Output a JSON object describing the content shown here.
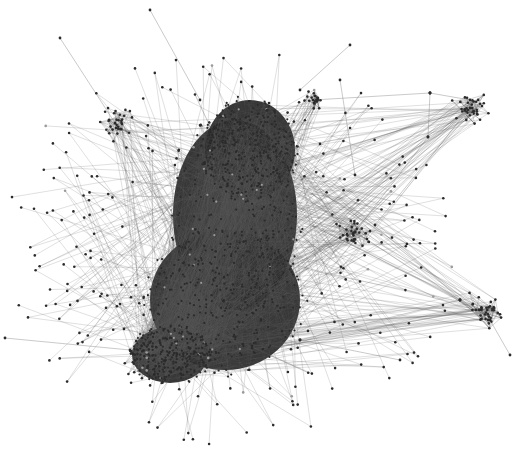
{
  "diagram": {
    "type": "network-graph",
    "width": 520,
    "height": 463,
    "colors": {
      "background": "#ffffff",
      "node": "#2b2b2b",
      "node_light": "#9a9a9a",
      "edge": "#5a5a5a",
      "core_fill": "#262626"
    },
    "core": {
      "description": "dense central cluster",
      "blobs": [
        {
          "cx": 235,
          "cy": 215,
          "rx": 62,
          "ry": 95
        },
        {
          "cx": 225,
          "cy": 300,
          "rx": 75,
          "ry": 70
        },
        {
          "cx": 170,
          "cy": 355,
          "rx": 38,
          "ry": 28
        },
        {
          "cx": 250,
          "cy": 150,
          "rx": 45,
          "ry": 50
        }
      ],
      "node_count": 900,
      "edge_count": 1400
    },
    "clusters": [
      {
        "name": "top-left",
        "cx": 115,
        "cy": 123,
        "r": 12,
        "nodes": 30
      },
      {
        "name": "top-center-spike",
        "cx": 313,
        "cy": 100,
        "r": 8,
        "nodes": 18
      },
      {
        "name": "top-right",
        "cx": 470,
        "cy": 108,
        "r": 14,
        "nodes": 40
      },
      {
        "name": "mid-right",
        "cx": 355,
        "cy": 232,
        "r": 12,
        "nodes": 30
      },
      {
        "name": "right-lower",
        "cx": 485,
        "cy": 310,
        "r": 14,
        "nodes": 40
      },
      {
        "name": "bottom-left",
        "cx": 140,
        "cy": 360,
        "r": 16,
        "nodes": 40
      }
    ],
    "peripheral_nodes": 260,
    "long_edges": [
      [
        313,
        100,
        430,
        93
      ],
      [
        430,
        93,
        470,
        100
      ],
      [
        430,
        93,
        428,
        137
      ],
      [
        428,
        137,
        355,
        232
      ],
      [
        470,
        108,
        375,
        225
      ],
      [
        355,
        232,
        460,
        300
      ],
      [
        460,
        300,
        300,
        340
      ],
      [
        460,
        300,
        488,
        320
      ],
      [
        60,
        38,
        115,
        123
      ],
      [
        150,
        10,
        200,
        100
      ],
      [
        350,
        45,
        300,
        90
      ],
      [
        5,
        338,
        130,
        350
      ],
      [
        510,
        355,
        490,
        320
      ],
      [
        340,
        80,
        355,
        175
      ],
      [
        300,
        340,
        400,
        360
      ]
    ]
  }
}
